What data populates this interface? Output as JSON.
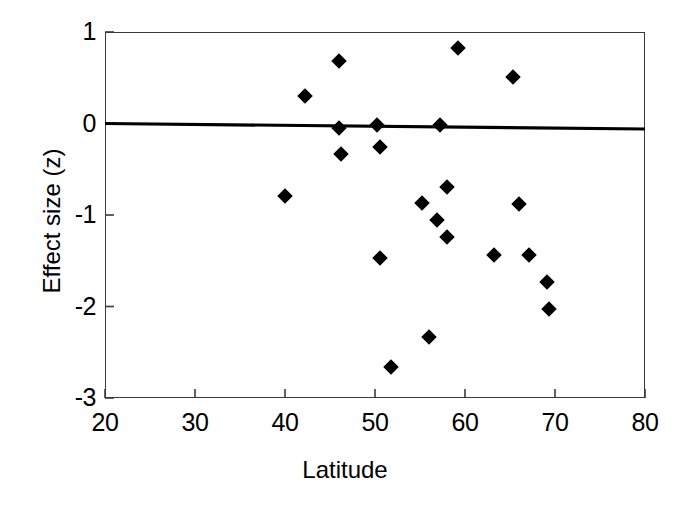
{
  "chart_data": {
    "type": "scatter",
    "title": "",
    "xlabel": "Latitude",
    "ylabel": "Effect size (z)",
    "xlim": [
      20,
      80
    ],
    "ylim": [
      -3,
      1
    ],
    "xticks": [
      20,
      30,
      40,
      50,
      60,
      70,
      80
    ],
    "yticks": [
      1,
      0,
      -1,
      -2,
      -3
    ],
    "xtick_labels": [
      "20",
      "30",
      "40",
      "50",
      "60",
      "70",
      "80"
    ],
    "ytick_labels": [
      "1",
      "0",
      "-1",
      "-2",
      "-3"
    ],
    "grid": false,
    "legend": false,
    "marker": "diamond",
    "marker_color": "#000000",
    "points": [
      {
        "x": 40.0,
        "y": -0.79
      },
      {
        "x": 42.2,
        "y": 0.3
      },
      {
        "x": 46.0,
        "y": 0.68
      },
      {
        "x": 46.0,
        "y": -0.05
      },
      {
        "x": 46.2,
        "y": -0.33
      },
      {
        "x": 50.2,
        "y": -0.02
      },
      {
        "x": 50.5,
        "y": -0.26
      },
      {
        "x": 50.5,
        "y": -1.47
      },
      {
        "x": 51.8,
        "y": -2.66
      },
      {
        "x": 55.2,
        "y": -0.87
      },
      {
        "x": 56.0,
        "y": -2.33
      },
      {
        "x": 56.9,
        "y": -1.05
      },
      {
        "x": 57.2,
        "y": -0.02
      },
      {
        "x": 58.0,
        "y": -0.69
      },
      {
        "x": 58.0,
        "y": -1.24
      },
      {
        "x": 59.2,
        "y": 0.82
      },
      {
        "x": 63.2,
        "y": -1.44
      },
      {
        "x": 65.3,
        "y": 0.51
      },
      {
        "x": 66.0,
        "y": -0.88
      },
      {
        "x": 67.1,
        "y": -1.44
      },
      {
        "x": 69.1,
        "y": -1.73
      },
      {
        "x": 69.3,
        "y": -2.03
      }
    ],
    "trend_line": {
      "name": "regression-line",
      "color": "#000000",
      "x_start": 20,
      "y_start": 0.0,
      "x_end": 80,
      "y_end": -0.06
    }
  }
}
